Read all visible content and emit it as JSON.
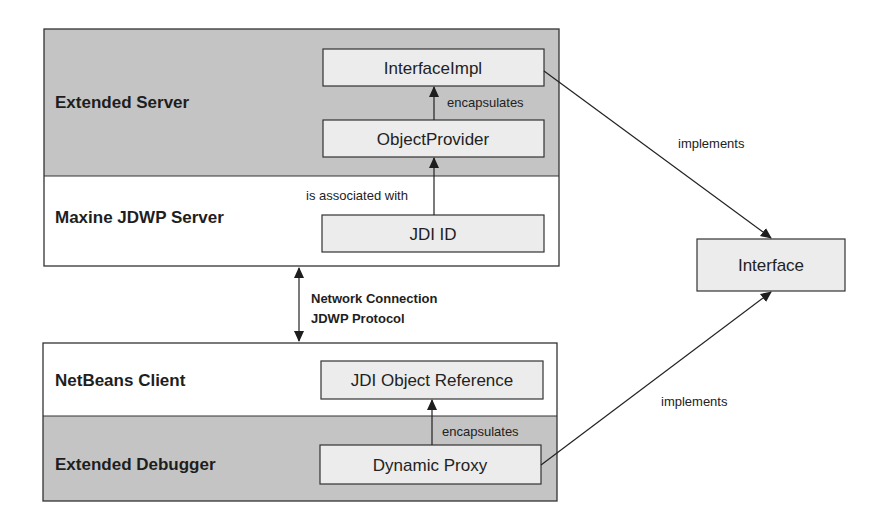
{
  "diagram": {
    "layers": {
      "extended_server": {
        "label": "Extended Server",
        "fill": "#c4c4c4"
      },
      "maxine_jdwp_server": {
        "label": "Maxine JDWP Server",
        "fill": "#ffffff"
      },
      "netbeans_client": {
        "label": "NetBeans Client",
        "fill": "#ffffff"
      },
      "extended_debugger": {
        "label": "Extended Debugger",
        "fill": "#c4c4c4"
      }
    },
    "nodes": {
      "interface_impl": {
        "label": "InterfaceImpl"
      },
      "object_provider": {
        "label": "ObjectProvider"
      },
      "jdi_id": {
        "label": "JDI ID"
      },
      "jdi_object_reference": {
        "label": "JDI Object Reference"
      },
      "dynamic_proxy": {
        "label": "Dynamic Proxy"
      },
      "interface": {
        "label": "Interface"
      }
    },
    "edges": {
      "server_encapsulates": {
        "label": "encapsulates",
        "from": "ObjectProvider",
        "to": "InterfaceImpl"
      },
      "is_associated_with": {
        "label": "is associated with",
        "from": "JDI ID",
        "to": "ObjectProvider"
      },
      "network": {
        "label_line1": "Network Connection",
        "label_line2": "JDWP Protocol"
      },
      "debugger_encapsulates": {
        "label": "encapsulates",
        "from": "Dynamic Proxy",
        "to": "JDI Object Reference"
      },
      "server_implements": {
        "label": "implements",
        "from": "InterfaceImpl",
        "to": "Interface"
      },
      "client_implements": {
        "label": "implements",
        "from": "Dynamic Proxy",
        "to": "Interface"
      }
    },
    "colors": {
      "gray_layer": "#c4c4c4",
      "node_fill": "#ececec",
      "stroke": "#333333"
    }
  }
}
